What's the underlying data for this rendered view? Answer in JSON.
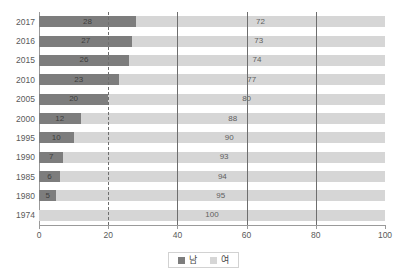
{
  "chart_data": {
    "type": "bar",
    "orientation": "horizontal",
    "stacked": true,
    "stack_total": 100,
    "title": "",
    "xlabel": "",
    "ylabel": "",
    "xlim": [
      0,
      100
    ],
    "xticks": [
      0,
      20,
      40,
      60,
      80,
      100
    ],
    "xtick_labels": [
      "0",
      "20",
      "40",
      "60",
      "80",
      "100"
    ],
    "grid": true,
    "gridlines": [
      {
        "value": 20,
        "style": "dashed"
      },
      {
        "value": 40,
        "style": "solid"
      },
      {
        "value": 60,
        "style": "solid"
      },
      {
        "value": 80,
        "style": "solid"
      }
    ],
    "legend_position": "bottom",
    "categories": [
      "2017",
      "2016",
      "2015",
      "2010",
      "2005",
      "2000",
      "1995",
      "1990",
      "1985",
      "1980",
      "1974"
    ],
    "series": [
      {
        "name": "남",
        "color": "#7d7d7d",
        "values": [
          28,
          27,
          26,
          23,
          20,
          12,
          10,
          7,
          6,
          5,
          0
        ],
        "labels": [
          "28",
          "27",
          "26",
          "23",
          "20",
          "12",
          "10",
          "7",
          "6",
          "5",
          ""
        ]
      },
      {
        "name": "여",
        "color": "#d6d6d6",
        "values": [
          72,
          73,
          74,
          77,
          80,
          88,
          90,
          93,
          94,
          95,
          100
        ],
        "labels": [
          "72",
          "73",
          "74",
          "77",
          "80",
          "88",
          "90",
          "93",
          "94",
          "95",
          "100"
        ]
      }
    ]
  },
  "legend": {
    "items": [
      {
        "label": "남",
        "color": "#7d7d7d"
      },
      {
        "label": "여",
        "color": "#d6d6d6"
      }
    ]
  },
  "colors": {
    "male": "#7d7d7d",
    "female": "#d6d6d6",
    "gridline": "#6e6e6e",
    "axis": "#9a9a9a",
    "text": "#5a5a5a",
    "background": "#ffffff"
  }
}
